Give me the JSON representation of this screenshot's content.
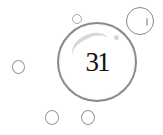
{
  "illustration": {
    "main_bubble": {
      "label": "31"
    },
    "colors": {
      "outline": "#8a8a8a",
      "text": "#111111",
      "background": "#ffffff"
    },
    "bubble_count": 6
  }
}
